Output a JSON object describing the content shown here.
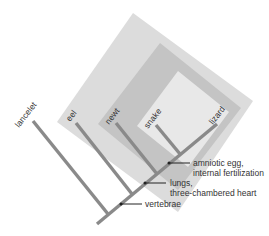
{
  "diagram": {
    "type": "cladogram",
    "colors": {
      "background": "#ffffff",
      "clade_vertebrates": "#dcdcdc",
      "clade_lungs": "#c2c2c2",
      "clade_amniotes": "#e6e6e6",
      "branch": "#8a8a8a",
      "text": "#333333",
      "pointer": "#222222"
    },
    "taxa": [
      {
        "name": "lancelet"
      },
      {
        "name": "eel"
      },
      {
        "name": "newt"
      },
      {
        "name": "snake"
      },
      {
        "name": "lizard"
      }
    ],
    "traits": [
      {
        "line1": "vertebrae",
        "line2": ""
      },
      {
        "line1": "lungs,",
        "line2": "three-chambered heart"
      },
      {
        "line1": "amniotic egg,",
        "line2": "internal fertilization"
      }
    ]
  }
}
